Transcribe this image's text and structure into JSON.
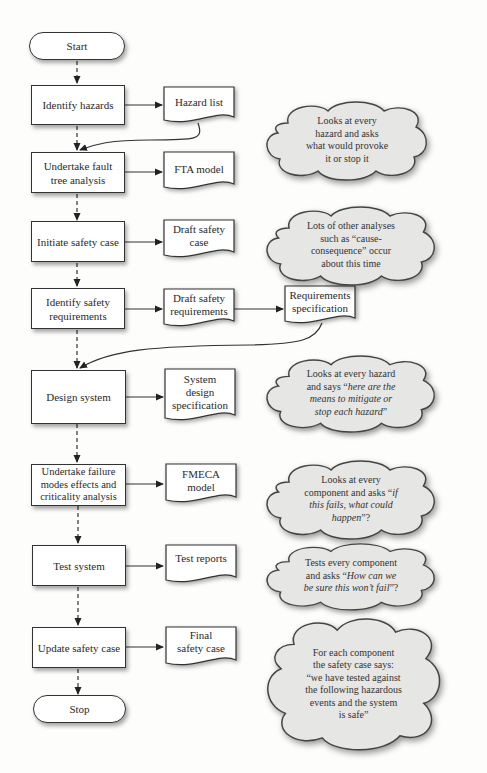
{
  "flow": {
    "start": "Start",
    "stop": "Stop",
    "steps": [
      {
        "label": "Identify hazards",
        "output": "Hazard list"
      },
      {
        "label": "Undertake fault tree analysis",
        "output": "FTA model"
      },
      {
        "label": "Initiate safety case",
        "output": "Draft safety case"
      },
      {
        "label": "Identify safety requirements",
        "output": "Draft safety requirements",
        "secondary_output": "Requirements specification"
      },
      {
        "label": "Design system",
        "output": "System design specification"
      },
      {
        "label": "Undertake failure modes effects and criticality analysis",
        "output": "FMECA model"
      },
      {
        "label": "Test system",
        "output": "Test reports"
      },
      {
        "label": "Update safety case",
        "output": "Final safety case"
      }
    ]
  },
  "notes": [
    {
      "lines": [
        "Looks at every",
        "hazard and asks",
        "what would provoke",
        "it or stop it"
      ]
    },
    {
      "lines": [
        "Lots of other analyses",
        "such as “cause-",
        "consequence” occur",
        "about this time"
      ]
    },
    {
      "lines": [
        "Looks at every hazard",
        "and says “<i>here are the</i>",
        "<i>means to mitigate or</i>",
        "<i>stop each hazard</i>”"
      ]
    },
    {
      "lines": [
        "Looks at every",
        "component and asks “<i>if</i>",
        "<i>this fails, what could</i>",
        "<i>happen</i>”?"
      ]
    },
    {
      "lines": [
        "Tests every component",
        "and asks “<i>How can we</i>",
        "<i>be sure this won’t fail</i>”?"
      ]
    },
    {
      "lines": [
        "For each component",
        "the safety case says:",
        "“we have tested against",
        "the following hazardous",
        "events and the system",
        "is safe”"
      ]
    }
  ],
  "colors": {
    "cloud_fill": "#e6e6e4",
    "stroke": "#333333",
    "box_fill": "#ffffff"
  }
}
